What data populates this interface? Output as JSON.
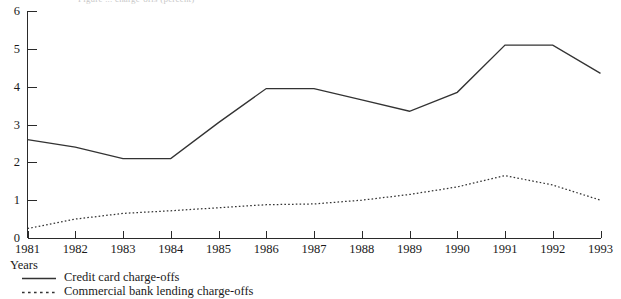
{
  "top_caption": "Figure ... charge-offs (percent)",
  "chart_data": {
    "type": "line",
    "title": "",
    "xlabel": "Years",
    "ylabel": "",
    "x": [
      1981,
      1982,
      1983,
      1984,
      1985,
      1986,
      1987,
      1988,
      1989,
      1990,
      1991,
      1992,
      1993
    ],
    "categories": [
      "1981",
      "1982",
      "1983",
      "1984",
      "1985",
      "1986",
      "1987",
      "1988",
      "1989",
      "1990",
      "1991",
      "1992",
      "1993"
    ],
    "xlim": [
      1981,
      1993
    ],
    "ylim": [
      0,
      6
    ],
    "yticks": [
      0,
      1,
      2,
      3,
      4,
      5,
      6
    ],
    "yticklabels": [
      "0",
      "1",
      "2",
      "3",
      "4",
      "5",
      "6"
    ],
    "grid": false,
    "legend_position": "below-left",
    "series": [
      {
        "name": "Credit card charge-offs",
        "style": "solid",
        "color": "#333333",
        "values": [
          2.6,
          2.4,
          2.1,
          2.1,
          3.05,
          3.95,
          3.95,
          3.65,
          3.35,
          3.85,
          5.1,
          5.1,
          4.35
        ]
      },
      {
        "name": "Commercial bank lending charge-offs",
        "style": "dotted",
        "color": "#333333",
        "values": [
          0.25,
          0.5,
          0.65,
          0.72,
          0.8,
          0.88,
          0.9,
          1.0,
          1.15,
          1.35,
          1.65,
          1.4,
          1.0
        ]
      }
    ]
  },
  "legend": {
    "items": [
      {
        "label": "Credit card charge-offs",
        "style": "solid"
      },
      {
        "label": "Commercial bank lending charge-offs",
        "style": "dotted"
      }
    ]
  }
}
